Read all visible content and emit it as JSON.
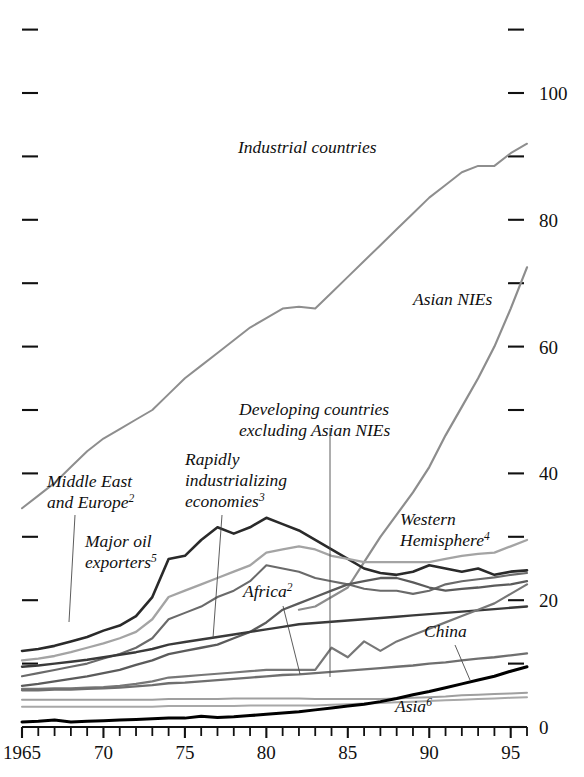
{
  "figure": {
    "clipped_top_text": "",
    "background": "#ffffff"
  },
  "axes": {
    "y_right_labels": [
      "100",
      "80",
      "60",
      "40",
      "20",
      "0"
    ],
    "y_right_values": [
      100,
      80,
      60,
      40,
      20,
      0
    ],
    "y_minor_values": [
      110,
      90,
      70,
      50,
      30,
      10
    ],
    "x_labels": [
      "1965",
      "70",
      "75",
      "80",
      "85",
      "90",
      "95"
    ],
    "x_label_values": [
      1965,
      1970,
      1975,
      1980,
      1985,
      1990,
      1995
    ],
    "x_min": 1965,
    "x_max": 1996,
    "y_min": 0,
    "y_max": 113
  },
  "labels": {
    "industrial": {
      "text": "Industrial countries",
      "sup": ""
    },
    "asian_nies": {
      "text": "Asian NIEs",
      "sup": ""
    },
    "developing_ex_nies_line1": "Developing countries",
    "developing_ex_nies_line2": "excluding Asian NIEs",
    "middle_east_line1": "Middle East",
    "middle_east_line2": "and Europe",
    "middle_east_sup": "2",
    "rapidly_line1": "Rapidly",
    "rapidly_line2": "industrializing",
    "rapidly_line3": "economies",
    "rapidly_sup": "3",
    "major_oil_line1": "Major oil",
    "major_oil_line2": "exporters",
    "major_oil_sup": "5",
    "western_line1": "Western",
    "western_line2": "Hemisphere",
    "western_sup": "4",
    "africa": "Africa",
    "africa_sup": "2",
    "china": "China",
    "asia": "Asia",
    "asia_sup": "6"
  },
  "chart_data": {
    "type": "line",
    "title": "",
    "xlabel": "",
    "ylabel": "",
    "xlim": [
      1965,
      1996
    ],
    "ylim": [
      0,
      113
    ],
    "grid": false,
    "legend": "inline-annotations",
    "x": [
      1965,
      1966,
      1967,
      1968,
      1969,
      1970,
      1971,
      1972,
      1973,
      1974,
      1975,
      1976,
      1977,
      1978,
      1979,
      1980,
      1981,
      1982,
      1983,
      1984,
      1985,
      1986,
      1987,
      1988,
      1989,
      1990,
      1991,
      1992,
      1993,
      1994,
      1995,
      1996
    ],
    "series": [
      {
        "name": "Industrial countries",
        "color": "#8e8e8e",
        "width": 2.0,
        "values": [
          34.5,
          36.5,
          38.5,
          41.0,
          43.5,
          45.5,
          47.0,
          48.5,
          50.0,
          52.5,
          55.0,
          57.0,
          59.0,
          61.0,
          63.0,
          64.5,
          66.0,
          66.3,
          66.0,
          68.5,
          71.0,
          73.5,
          76.0,
          78.5,
          81.0,
          83.5,
          85.5,
          87.5,
          88.5,
          88.5,
          90.5,
          92.0
        ]
      },
      {
        "name": "Asian NIEs",
        "color": "#8d8d8d",
        "width": 2.2,
        "values": [
          null,
          null,
          null,
          null,
          null,
          null,
          null,
          null,
          null,
          null,
          null,
          null,
          null,
          null,
          null,
          null,
          null,
          18.5,
          19.0,
          20.5,
          22.0,
          26.0,
          30.0,
          33.5,
          37.0,
          41.0,
          46.0,
          50.5,
          55.0,
          60.0,
          66.0,
          72.5
        ]
      },
      {
        "name": "Developing countries excluding Asian NIEs",
        "color": "#6a6a6a",
        "width": 2.1,
        "values": [
          8.0,
          8.5,
          9.0,
          9.5,
          10.0,
          10.8,
          11.5,
          12.5,
          14.0,
          17.0,
          18.0,
          19.0,
          20.5,
          21.5,
          23.0,
          25.5,
          25.0,
          24.5,
          23.5,
          23.0,
          22.5,
          21.8,
          21.5,
          21.5,
          21.0,
          21.5,
          22.5,
          23.0,
          23.3,
          23.6,
          24.0,
          24.3
        ]
      },
      {
        "name": "Middle East and Europe",
        "color": "#2a2a2a",
        "width": 2.6,
        "values": [
          12.0,
          12.3,
          12.8,
          13.5,
          14.2,
          15.2,
          16.0,
          17.5,
          20.5,
          26.5,
          27.0,
          29.5,
          31.5,
          30.5,
          31.5,
          33.0,
          32.0,
          31.0,
          29.5,
          28.0,
          26.5,
          25.0,
          24.3,
          24.0,
          24.5,
          25.5,
          25.0,
          24.5,
          25.0,
          24.0,
          24.5,
          24.7
        ]
      },
      {
        "name": "Major oil exporters",
        "color": "#a4a4a4",
        "width": 2.3,
        "values": [
          10.5,
          10.8,
          11.2,
          11.8,
          12.5,
          13.2,
          14.0,
          15.0,
          17.0,
          20.5,
          21.5,
          22.5,
          23.5,
          24.5,
          25.5,
          27.5,
          28.0,
          28.5,
          28.0,
          27.0,
          26.5,
          26.0,
          26.0,
          26.0,
          26.0,
          26.0,
          26.5,
          27.0,
          27.3,
          27.5,
          28.5,
          29.5
        ]
      },
      {
        "name": "Rapidly industrializing economies",
        "color": "#5b5b5b",
        "width": 2.3,
        "values": [
          6.5,
          6.8,
          7.2,
          7.6,
          8.0,
          8.5,
          9.0,
          9.8,
          10.5,
          11.5,
          12.0,
          12.5,
          13.0,
          14.0,
          15.0,
          16.5,
          18.5,
          19.5,
          20.5,
          21.5,
          22.5,
          23.0,
          23.5,
          23.5,
          22.8,
          22.0,
          21.5,
          21.8,
          22.0,
          22.3,
          22.5,
          23.0
        ]
      },
      {
        "name": "Africa",
        "color": "#3a3a3a",
        "width": 2.4,
        "values": [
          9.5,
          9.7,
          10.0,
          10.3,
          10.6,
          11.0,
          11.4,
          11.8,
          12.3,
          13.0,
          13.4,
          13.8,
          14.2,
          14.6,
          15.0,
          15.4,
          15.8,
          16.2,
          16.4,
          16.6,
          16.8,
          17.0,
          17.2,
          17.4,
          17.6,
          17.8,
          18.0,
          18.2,
          18.4,
          18.6,
          18.8,
          19.0
        ]
      },
      {
        "name": "Unlabeled mid-grey series",
        "color": "#777777",
        "width": 2.2,
        "values": [
          6.0,
          6.0,
          6.1,
          6.1,
          6.2,
          6.3,
          6.5,
          6.8,
          7.2,
          7.8,
          8.0,
          8.2,
          8.4,
          8.6,
          8.8,
          9.0,
          9.0,
          9.0,
          9.0,
          12.5,
          11.0,
          13.5,
          12.0,
          13.5,
          14.5,
          15.5,
          16.5,
          17.5,
          18.5,
          19.5,
          21.0,
          22.5
        ]
      },
      {
        "name": "China",
        "color": "#6f6f6f",
        "width": 2.3,
        "values": [
          5.8,
          5.8,
          5.9,
          5.9,
          6.0,
          6.1,
          6.2,
          6.4,
          6.6,
          6.9,
          7.0,
          7.2,
          7.4,
          7.6,
          7.8,
          8.0,
          8.2,
          8.3,
          8.5,
          8.7,
          8.9,
          9.1,
          9.3,
          9.5,
          9.7,
          10.0,
          10.2,
          10.5,
          10.8,
          11.0,
          11.3,
          11.6
        ]
      },
      {
        "name": "Lower light series",
        "color": "#9f9f9f",
        "width": 2.0,
        "values": [
          4.3,
          4.3,
          4.3,
          4.3,
          4.3,
          4.3,
          4.3,
          4.3,
          4.3,
          4.4,
          4.4,
          4.4,
          4.4,
          4.5,
          4.5,
          4.5,
          4.5,
          4.5,
          4.4,
          4.4,
          4.4,
          4.4,
          4.4,
          4.5,
          4.6,
          4.7,
          4.8,
          5.0,
          5.1,
          5.2,
          5.3,
          5.4
        ]
      },
      {
        "name": "Asia",
        "color": "#a8a8a8",
        "width": 2.0,
        "values": [
          3.2,
          3.2,
          3.2,
          3.2,
          3.2,
          3.2,
          3.2,
          3.2,
          3.2,
          3.3,
          3.3,
          3.3,
          3.3,
          3.3,
          3.4,
          3.4,
          3.4,
          3.4,
          3.4,
          3.5,
          3.6,
          3.7,
          3.8,
          3.9,
          4.0,
          4.1,
          4.2,
          4.3,
          4.4,
          4.5,
          4.6,
          4.7
        ]
      },
      {
        "name": "Bottom black series",
        "color": "#000000",
        "width": 3.0,
        "values": [
          0.8,
          0.9,
          1.1,
          0.8,
          0.9,
          1.0,
          1.1,
          1.2,
          1.3,
          1.4,
          1.4,
          1.7,
          1.5,
          1.6,
          1.8,
          2.0,
          2.2,
          2.4,
          2.7,
          3.0,
          3.3,
          3.6,
          4.0,
          4.5,
          5.1,
          5.6,
          6.2,
          6.8,
          7.4,
          8.0,
          8.8,
          9.5
        ]
      }
    ]
  }
}
